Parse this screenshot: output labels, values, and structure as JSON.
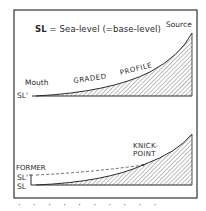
{
  "diagram": {
    "legend": {
      "abbr": "SL",
      "text": " = Sea-level (=base-level)"
    },
    "top_panel": {
      "source_label": "Source",
      "mouth_label": "Mouth",
      "sl_label": "SL'",
      "profile_word1": "GRADED",
      "profile_word2": "PROFILE"
    },
    "bottom_panel": {
      "knickpoint_line1": "KNICK-",
      "knickpoint_line2": "POINT",
      "former_label": "FORMER",
      "former_sl_label": "SL'",
      "new_sl_label": "SL"
    },
    "caption_fragment": "· · · · · · · · · ·",
    "colors": {
      "ink": "#2a2a2a",
      "frame": "#333333",
      "hatch": "#555555",
      "background": "#ffffff"
    }
  }
}
